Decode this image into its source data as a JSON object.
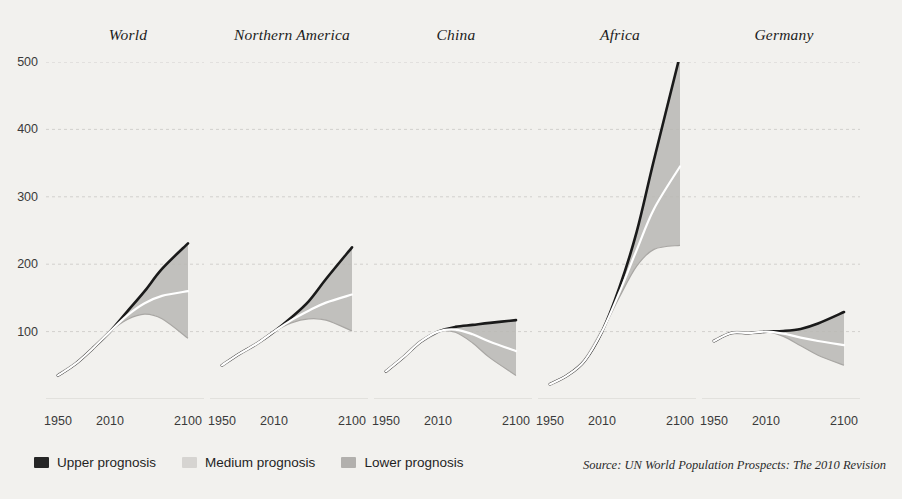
{
  "legend": {
    "items": [
      {
        "label": "Upper prognosis",
        "color": "#262626",
        "name": "legend-upper"
      },
      {
        "label": "Medium prognosis",
        "color": "#d6d4d1",
        "name": "legend-medium"
      },
      {
        "label": "Lower prognosis",
        "color": "#b2b0ad",
        "name": "legend-lower"
      }
    ]
  },
  "source": "Source: UN World Population Prospects: The 2010 Revision",
  "colors": {
    "background": "#f2f1ee",
    "band": "#b9b7b4",
    "upper_edge": "#1a1a1a",
    "medium_line": "#ffffff",
    "gridline": "#d2d0cd",
    "axis_text": "#3a3a3a"
  },
  "chart_data": {
    "type": "line",
    "title": "",
    "xlabel": "",
    "ylabel": "",
    "ylim": [
      0,
      500
    ],
    "yticks": [
      100,
      200,
      300,
      400,
      500
    ],
    "xticks": [
      1950,
      2010,
      2100
    ],
    "xlim": [
      1950,
      2100
    ],
    "grid": true,
    "legend_position": "bottom-left",
    "note": "Indexed population, 1950 = baseline; fan charts show UN upper / medium / lower variants per region.",
    "panels": [
      {
        "name": "World",
        "series": [
          {
            "name": "Medium prognosis",
            "x": [
              1950,
              1970,
              1990,
              2010,
              2030,
              2050,
              2070,
              2100
            ],
            "values": [
              35,
              52,
              75,
              100,
              124,
              142,
              153,
              160
            ]
          },
          {
            "name": "Upper prognosis",
            "x": [
              1950,
              1970,
              1990,
              2010,
              2030,
              2050,
              2070,
              2100
            ],
            "values": [
              35,
              52,
              75,
              100,
              130,
              160,
              193,
              231
            ]
          },
          {
            "name": "Lower prognosis",
            "x": [
              1950,
              1970,
              1990,
              2010,
              2030,
              2050,
              2070,
              2100
            ],
            "values": [
              35,
              52,
              75,
              100,
              118,
              126,
              119,
              90
            ]
          }
        ]
      },
      {
        "name": "Northern America",
        "series": [
          {
            "name": "Medium prognosis",
            "x": [
              1950,
              1970,
              1990,
              2010,
              2030,
              2050,
              2070,
              2100
            ],
            "values": [
              50,
              67,
              82,
              100,
              117,
              131,
              143,
              155
            ]
          },
          {
            "name": "Upper prognosis",
            "x": [
              1950,
              1970,
              1990,
              2010,
              2030,
              2050,
              2070,
              2100
            ],
            "values": [
              50,
              67,
              82,
              100,
              121,
              145,
              178,
              225
            ]
          },
          {
            "name": "Lower prognosis",
            "x": [
              1950,
              1970,
              1990,
              2010,
              2030,
              2050,
              2070,
              2100
            ],
            "values": [
              50,
              67,
              82,
              100,
              113,
              119,
              117,
              101
            ]
          }
        ]
      },
      {
        "name": "China",
        "series": [
          {
            "name": "Medium prognosis",
            "x": [
              1950,
              1970,
              1990,
              2010,
              2030,
              2050,
              2070,
              2100
            ],
            "values": [
              41,
              62,
              85,
              100,
              103,
              96,
              85,
              71
            ]
          },
          {
            "name": "Upper prognosis",
            "x": [
              1950,
              1970,
              1990,
              2010,
              2030,
              2050,
              2070,
              2100
            ],
            "values": [
              41,
              62,
              85,
              100,
              107,
              110,
              113,
              117
            ]
          },
          {
            "name": "Lower prognosis",
            "x": [
              1950,
              1970,
              1990,
              2010,
              2030,
              2050,
              2070,
              2100
            ],
            "values": [
              41,
              62,
              85,
              100,
              99,
              83,
              61,
              35
            ]
          }
        ]
      },
      {
        "name": "Africa",
        "series": [
          {
            "name": "Medium prognosis",
            "x": [
              1950,
              1970,
              1990,
              2010,
              2030,
              2050,
              2070,
              2100
            ],
            "values": [
              22,
              35,
              57,
              100,
              158,
              221,
              282,
              345
            ]
          },
          {
            "name": "Upper prognosis",
            "x": [
              1950,
              1970,
              1990,
              2010,
              2030,
              2050,
              2070,
              2100
            ],
            "values": [
              22,
              35,
              57,
              100,
              165,
              248,
              355,
              510
            ]
          },
          {
            "name": "Lower prognosis",
            "x": [
              1950,
              1970,
              1990,
              2010,
              2030,
              2050,
              2070,
              2100
            ],
            "values": [
              22,
              35,
              57,
              100,
              151,
              197,
              222,
              228
            ]
          }
        ]
      },
      {
        "name": "Germany",
        "series": [
          {
            "name": "Medium prognosis",
            "x": [
              1950,
              1970,
              1990,
              2010,
              2030,
              2050,
              2070,
              2100
            ],
            "values": [
              86,
              98,
              98,
              100,
              97,
              91,
              86,
              80
            ]
          },
          {
            "name": "Upper prognosis",
            "x": [
              1950,
              1970,
              1990,
              2010,
              2030,
              2050,
              2070,
              2100
            ],
            "values": [
              86,
              98,
              98,
              100,
              101,
              104,
              112,
              129
            ]
          },
          {
            "name": "Lower prognosis",
            "x": [
              1950,
              1970,
              1990,
              2010,
              2030,
              2050,
              2070,
              2100
            ],
            "values": [
              86,
              98,
              98,
              100,
              93,
              79,
              65,
              50
            ]
          }
        ]
      }
    ]
  }
}
